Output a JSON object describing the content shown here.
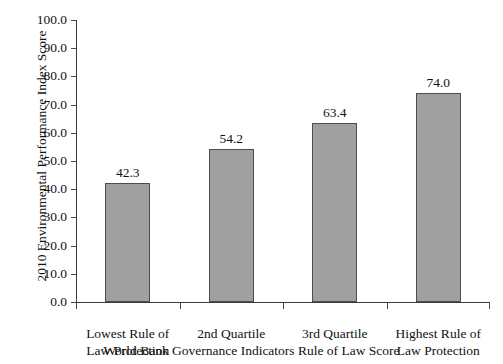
{
  "caption_strip": {
    "text": ""
  },
  "chart_data": {
    "type": "bar",
    "title": "",
    "xlabel": "World Bank Governance Indicators Rule of Law Score",
    "ylabel": "2010 Environmental Performance Index Score",
    "categories": [
      "Lowest Rule of\nLaw Protection",
      "2nd Quartile",
      "3rd Quartile",
      "Highest Rule of\nLaw Protection"
    ],
    "category_lines": [
      [
        "Lowest Rule of",
        "Law Protection"
      ],
      [
        "2nd Quartile",
        ""
      ],
      [
        "3rd Quartile",
        ""
      ],
      [
        "Highest Rule of",
        "Law Protection"
      ]
    ],
    "values": [
      42.3,
      54.2,
      63.4,
      74.0
    ],
    "value_labels": [
      "42.3",
      "54.2",
      "63.4",
      "74.0"
    ],
    "ylim": [
      0.0,
      100.0
    ],
    "ytick_values": [
      100.0,
      90.0,
      80.0,
      70.0,
      60.0,
      50.0,
      40.0,
      30.0,
      20.0,
      10.0,
      0.0
    ],
    "ytick_labels": [
      "100.0",
      "90.0",
      "80.0",
      "70.0",
      "60.0",
      "50.0",
      "40.0",
      "30.0",
      "20.0",
      "10.0",
      "0.0"
    ],
    "grid": false,
    "legend": false,
    "bar_color": "#a0a0a0",
    "bar_border_color": "#4d4d4d",
    "axis_color": "#3b3b3b"
  }
}
